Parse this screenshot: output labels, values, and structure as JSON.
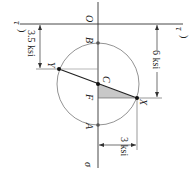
{
  "diagram": {
    "type": "mohr-circle",
    "orientation": "rotated-90-clockwise",
    "axes": {
      "sigma_label": "σ",
      "tau_label_top": "τ",
      "tau_label_bottom": "τ",
      "origin_label": "O"
    },
    "points": {
      "A": "A",
      "B": "B",
      "C": "C",
      "F": "F",
      "X": "X",
      "Y": "Y"
    },
    "dimensions": {
      "dim_6": "6 ksi",
      "dim_3_5": "3.5 ksi",
      "dim_3": "3 ksi"
    },
    "colors": {
      "line": "#333333",
      "circle": "#777777",
      "shade": "#c8c8c8",
      "point": "#111111"
    }
  }
}
